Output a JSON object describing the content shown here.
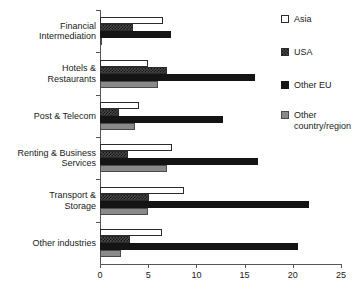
{
  "chart_data": {
    "type": "bar",
    "orientation": "horizontal",
    "title": "",
    "subtitle": "",
    "xlabel": "",
    "ylabel": "",
    "xlim": [
      0,
      25
    ],
    "xticks": [
      0,
      5,
      10,
      15,
      20,
      25
    ],
    "xticklabels": [
      "0",
      "5",
      "10",
      "15",
      "20",
      "25"
    ],
    "grid": false,
    "legend_position": "right",
    "categories": [
      "Financial\nIntermediation",
      "Hotels &\nRestaurants",
      "Post & Telecom",
      "Renting & Business\nServices",
      "Transport &\nStorage",
      "Other industries"
    ],
    "series": [
      {
        "name": "Asia",
        "key": "asia",
        "color": "#ffffff",
        "pattern": "dotted",
        "values": [
          6.5,
          5.0,
          4.0,
          7.5,
          8.7,
          6.4
        ]
      },
      {
        "name": "USA",
        "key": "usa",
        "color": "#4a4a4a",
        "pattern": "checkered",
        "values": [
          3.4,
          7.0,
          2.0,
          2.9,
          5.1,
          3.1
        ]
      },
      {
        "name": "Other EU",
        "key": "othereu",
        "color": "#141414",
        "pattern": "solid",
        "values": [
          7.4,
          16.1,
          12.8,
          16.4,
          21.7,
          20.5
        ]
      },
      {
        "name": "Other\ncountry/region",
        "key": "otherreg",
        "color": "#8a8a8a",
        "pattern": "solid-gray",
        "values": [
          0.1,
          6.0,
          3.6,
          7.0,
          5.0,
          2.2
        ]
      }
    ]
  },
  "legend": {
    "items": [
      {
        "label": "Asia",
        "swatch": "asia"
      },
      {
        "label": "USA",
        "swatch": "usa"
      },
      {
        "label": "Other EU",
        "swatch": "othereu"
      },
      {
        "label": "Other\ncountry/region",
        "swatch": "otherreg"
      }
    ]
  }
}
